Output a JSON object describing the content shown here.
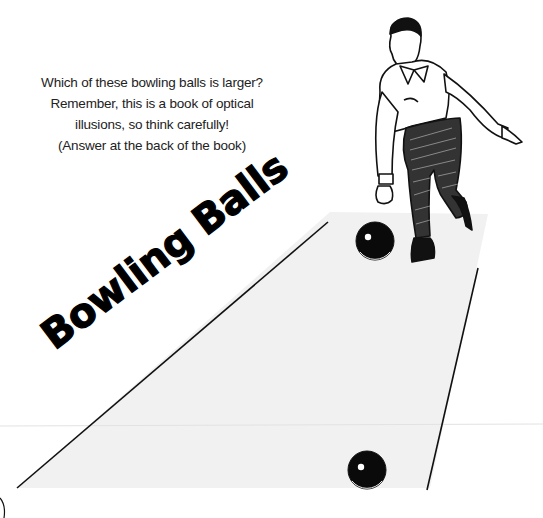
{
  "page": {
    "prompt_lines": [
      "Which of these bowling balls is larger?",
      "Remember, this is a book of optical",
      "illusions, so think carefully!",
      "(Answer at the back of the book)"
    ],
    "title": "Bowling Balls"
  },
  "illustration": {
    "figure": "bowler releasing ball",
    "lane_color": "#f1f1f1",
    "line_color": "#111111",
    "balls": [
      {
        "name": "upper-ball",
        "cx": 375,
        "cy": 241,
        "r": 19
      },
      {
        "name": "lower-ball",
        "cx": 367,
        "cy": 470,
        "r": 19
      }
    ]
  }
}
